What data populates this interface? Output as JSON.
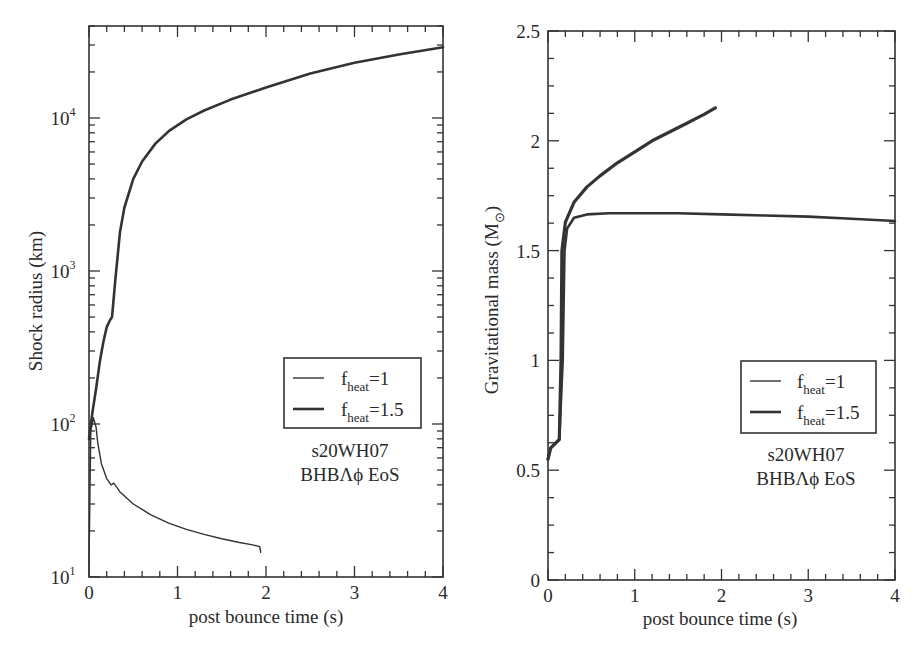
{
  "chart_data": [
    {
      "type": "line",
      "panel": "left",
      "title": "",
      "xlabel": "post bounce time (s)",
      "ylabel": "Shock radius (km)",
      "yscale": "log",
      "xlim": [
        0,
        4
      ],
      "ylim": [
        10,
        40000
      ],
      "xticks": [
        "0",
        "1",
        "2",
        "3",
        "4"
      ],
      "yticks": [
        {
          "base": "10",
          "exp": "1"
        },
        {
          "base": "10",
          "exp": "2"
        },
        {
          "base": "10",
          "exp": "3"
        },
        {
          "base": "10",
          "exp": "4"
        }
      ],
      "legend": [
        {
          "label": "f",
          "sub": "heat",
          "value": "=1",
          "width": 1.4
        },
        {
          "label": "f",
          "sub": "heat",
          "value": "=1.5",
          "width": 2.6
        }
      ],
      "annotation": [
        "s20WH07",
        "BHBΛϕ EoS"
      ],
      "series": [
        {
          "name": "f_heat=1",
          "x": [
            0.0,
            0.02,
            0.05,
            0.08,
            0.1,
            0.14,
            0.2,
            0.25,
            0.28,
            0.35,
            0.5,
            0.7,
            0.9,
            1.1,
            1.3,
            1.5,
            1.7,
            1.85,
            1.93,
            1.94
          ],
          "y": [
            12,
            90,
            110,
            95,
            75,
            55,
            44,
            40,
            41,
            36,
            30,
            25.5,
            22.5,
            20.5,
            19,
            17.8,
            16.8,
            16.2,
            15.8,
            14.5
          ]
        },
        {
          "name": "f_heat=1.5",
          "x": [
            0.0,
            0.04,
            0.08,
            0.12,
            0.16,
            0.2,
            0.24,
            0.26,
            0.3,
            0.35,
            0.4,
            0.5,
            0.6,
            0.75,
            0.9,
            1.1,
            1.3,
            1.6,
            2.0,
            2.5,
            3.0,
            3.5,
            4.0
          ],
          "y": [
            80,
            120,
            170,
            250,
            340,
            430,
            480,
            500,
            900,
            1800,
            2600,
            4000,
            5200,
            6800,
            8200,
            9800,
            11200,
            13200,
            15800,
            19500,
            23000,
            26000,
            29000
          ]
        }
      ]
    },
    {
      "type": "line",
      "panel": "right",
      "title": "",
      "xlabel": "post bounce time (s)",
      "ylabel": "Gravitational mass (M",
      "ylabel_sub": "⊙",
      "ylabel_close": ")",
      "xlim": [
        0,
        4
      ],
      "ylim": [
        0,
        2.5
      ],
      "xticks": [
        "0",
        "1",
        "2",
        "3",
        "4"
      ],
      "yticks": [
        "0",
        "0.5",
        "1",
        "1.5",
        "2",
        "2.5"
      ],
      "legend": [
        {
          "label": "f",
          "sub": "heat",
          "value": "=1",
          "width": 1.4
        },
        {
          "label": "f",
          "sub": "heat",
          "value": "=1.5",
          "width": 2.6
        }
      ],
      "annotation": [
        "s20WH07",
        "BHBΛϕ EoS"
      ],
      "series": [
        {
          "name": "f_heat=1",
          "x": [
            0.0,
            0.03,
            0.08,
            0.13,
            0.15,
            0.16,
            0.2,
            0.3,
            0.45,
            0.6,
            0.8,
            1.0,
            1.2,
            1.4,
            1.6,
            1.8,
            1.93
          ],
          "y": [
            0.55,
            0.6,
            0.62,
            0.64,
            1.0,
            1.5,
            1.63,
            1.72,
            1.79,
            1.84,
            1.9,
            1.95,
            2.0,
            2.04,
            2.08,
            2.12,
            2.15
          ]
        },
        {
          "name": "f_heat=1.5",
          "x": [
            0.0,
            0.03,
            0.08,
            0.13,
            0.17,
            0.19,
            0.22,
            0.3,
            0.45,
            0.7,
            1.0,
            1.5,
            2.0,
            2.5,
            3.0,
            3.5,
            4.0
          ],
          "y": [
            0.55,
            0.6,
            0.62,
            0.64,
            1.0,
            1.5,
            1.6,
            1.65,
            1.665,
            1.67,
            1.67,
            1.67,
            1.665,
            1.66,
            1.655,
            1.645,
            1.635
          ]
        }
      ]
    }
  ]
}
